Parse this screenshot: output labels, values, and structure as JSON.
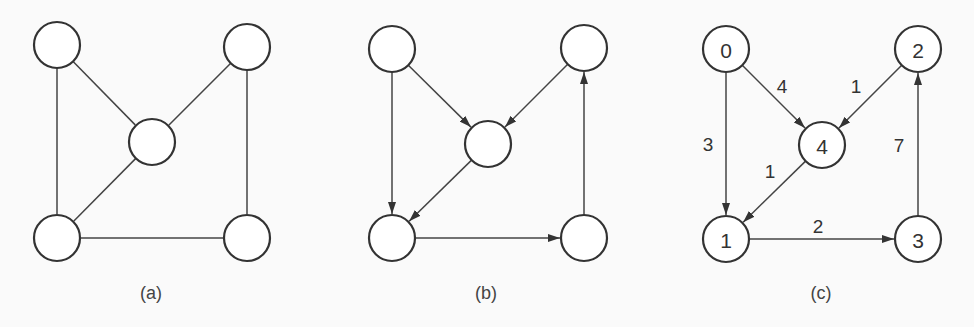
{
  "figure": {
    "node_radius": 23,
    "stroke_color": "#333333",
    "background": "#fafafa",
    "panels": [
      {
        "id": "a",
        "caption": "(a)",
        "caption_pos": [
          151,
          293
        ],
        "directed": false,
        "nodes": [
          {
            "id": "tl",
            "x": 57,
            "y": 45,
            "label": ""
          },
          {
            "id": "tr",
            "x": 247,
            "y": 47,
            "label": ""
          },
          {
            "id": "c",
            "x": 152,
            "y": 142,
            "label": ""
          },
          {
            "id": "bl",
            "x": 57,
            "y": 238,
            "label": ""
          },
          {
            "id": "br",
            "x": 247,
            "y": 238,
            "label": ""
          }
        ],
        "edges": [
          {
            "from": "tl",
            "to": "bl",
            "label": ""
          },
          {
            "from": "tl",
            "to": "c",
            "label": ""
          },
          {
            "from": "tr",
            "to": "c",
            "label": ""
          },
          {
            "from": "c",
            "to": "bl",
            "label": ""
          },
          {
            "from": "tr",
            "to": "br",
            "label": ""
          },
          {
            "from": "bl",
            "to": "br",
            "label": ""
          }
        ]
      },
      {
        "id": "b",
        "caption": "(b)",
        "caption_pos": [
          486,
          293
        ],
        "directed": true,
        "nodes": [
          {
            "id": "tl",
            "x": 392,
            "y": 49,
            "label": ""
          },
          {
            "id": "tr",
            "x": 584,
            "y": 48,
            "label": ""
          },
          {
            "id": "c",
            "x": 488,
            "y": 144,
            "label": ""
          },
          {
            "id": "bl",
            "x": 392,
            "y": 238,
            "label": ""
          },
          {
            "id": "br",
            "x": 584,
            "y": 238,
            "label": ""
          }
        ],
        "edges": [
          {
            "from": "tl",
            "to": "bl",
            "label": ""
          },
          {
            "from": "tl",
            "to": "c",
            "label": ""
          },
          {
            "from": "tr",
            "to": "c",
            "label": ""
          },
          {
            "from": "c",
            "to": "bl",
            "label": ""
          },
          {
            "from": "bl",
            "to": "br",
            "label": ""
          },
          {
            "from": "br",
            "to": "tr",
            "label": ""
          }
        ]
      },
      {
        "id": "c",
        "caption": "(c)",
        "caption_pos": [
          821,
          293
        ],
        "directed": true,
        "nodes": [
          {
            "id": "0",
            "x": 726,
            "y": 49,
            "label": "0"
          },
          {
            "id": "2",
            "x": 918,
            "y": 49,
            "label": "2"
          },
          {
            "id": "4",
            "x": 822,
            "y": 145,
            "label": "4"
          },
          {
            "id": "1",
            "x": 726,
            "y": 239,
            "label": "1"
          },
          {
            "id": "3",
            "x": 918,
            "y": 239,
            "label": "3"
          }
        ],
        "edges": [
          {
            "from": "0",
            "to": "1",
            "label": "3",
            "lx": 708,
            "ly": 144
          },
          {
            "from": "0",
            "to": "4",
            "label": "4",
            "lx": 782,
            "ly": 86
          },
          {
            "from": "2",
            "to": "4",
            "label": "1",
            "lx": 856,
            "ly": 86
          },
          {
            "from": "4",
            "to": "1",
            "label": "1",
            "lx": 770,
            "ly": 171
          },
          {
            "from": "1",
            "to": "3",
            "label": "2",
            "lx": 818,
            "ly": 226
          },
          {
            "from": "3",
            "to": "2",
            "label": "7",
            "lx": 899,
            "ly": 145
          }
        ]
      }
    ]
  }
}
